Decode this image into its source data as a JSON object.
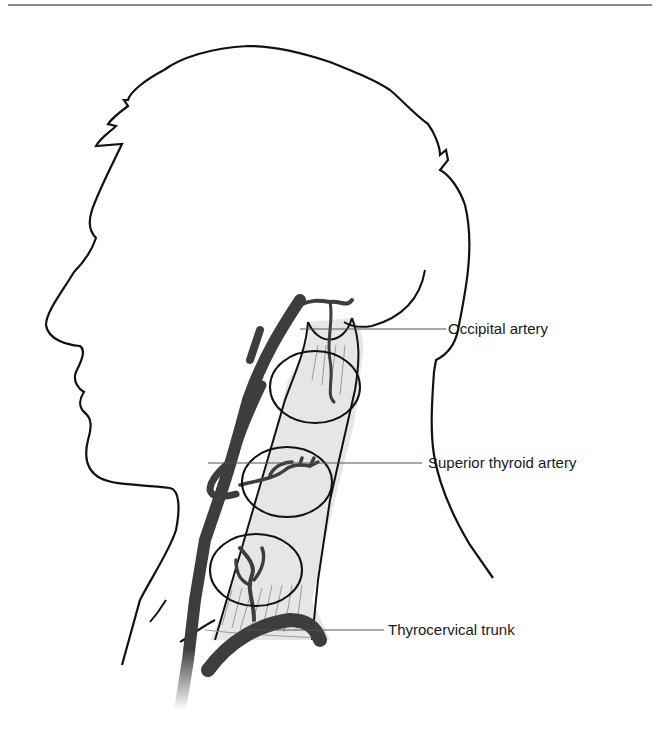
{
  "figure": {
    "colors": {
      "outline": "#111111",
      "artery": "#3d3d3d",
      "muscle_fill": "#e6e6e6",
      "leader_line": "#555555",
      "top_rule": "#8a8a8a",
      "label_text": "#1a1a1a"
    },
    "labels": [
      {
        "id": "occipital",
        "text": "Occipital artery"
      },
      {
        "id": "superior_thyroid",
        "text": "Superior thyroid artery"
      },
      {
        "id": "thyrocervical",
        "text": "Thyrocervical trunk"
      }
    ],
    "circled_regions": [
      {
        "id": "upper",
        "description": "upper third supplied by occipital artery"
      },
      {
        "id": "middle",
        "description": "middle third supplied by superior thyroid artery"
      },
      {
        "id": "lower",
        "description": "lower third supplied by thyrocervical trunk"
      }
    ]
  }
}
